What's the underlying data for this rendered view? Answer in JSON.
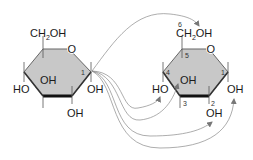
{
  "diagram": {
    "type": "chemical-structure",
    "colors": {
      "ring_fill": "#c8c8c8",
      "ring_stroke": "#555555",
      "bold_edge": "#111111",
      "arrow": "#888888"
    },
    "left_ring": {
      "ch2oh": "CH",
      "ch2oh_sub": "2",
      "ch2oh_tail": "OH",
      "oxygen": "O",
      "carbon_1": "1",
      "ho_left": "HO",
      "oh_inner": "OH",
      "oh_right": "OH",
      "oh_bottom": "OH"
    },
    "right_ring": {
      "ch2oh": "CH",
      "ch2oh_sub": "2",
      "ch2oh_tail": "OH",
      "oxygen": "O",
      "carbon_1": "1",
      "carbon_2": "2",
      "carbon_3": "3",
      "carbon_4": "4",
      "carbon_5": "5",
      "carbon_6": "6",
      "ho_left": "HO",
      "oh_inner": "OH",
      "oh_right": "OH",
      "oh_bottom": "OH"
    }
  }
}
